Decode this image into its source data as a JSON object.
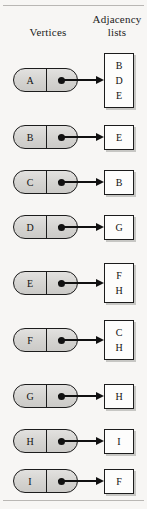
{
  "figure": {
    "background_color": "#f7f6f4",
    "node_fill_color": "#d9d8d6",
    "box_fill_color": "#fdfdfc",
    "line_color": "#1c1c1c"
  },
  "headers": {
    "vertices": "Vertices",
    "adjacency_line1": "Adjacency",
    "adjacency_line2": "lists"
  },
  "rows": [
    {
      "vertex": "A",
      "adjacency": [
        "B",
        "D",
        "E"
      ]
    },
    {
      "vertex": "B",
      "adjacency": [
        "E"
      ]
    },
    {
      "vertex": "C",
      "adjacency": [
        "B"
      ]
    },
    {
      "vertex": "D",
      "adjacency": [
        "G"
      ]
    },
    {
      "vertex": "E",
      "adjacency": [
        "F",
        "H"
      ]
    },
    {
      "vertex": "F",
      "adjacency": [
        "C",
        "H"
      ]
    },
    {
      "vertex": "G",
      "adjacency": [
        "H"
      ]
    },
    {
      "vertex": "H",
      "adjacency": [
        "I"
      ]
    },
    {
      "vertex": "I",
      "adjacency": [
        "F"
      ]
    }
  ]
}
